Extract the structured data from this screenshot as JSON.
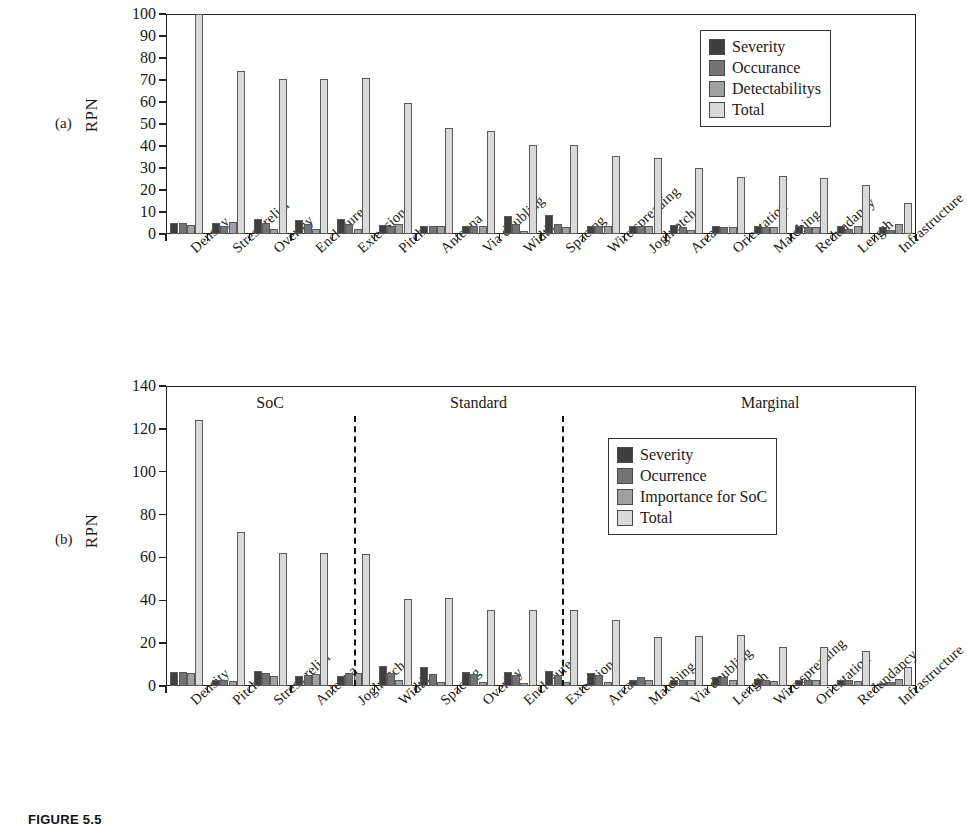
{
  "figure": {
    "caption": "FIGURE 5.5",
    "panel_a_tag": "(a)",
    "panel_b_tag": "(b)"
  },
  "chart_data": [
    {
      "id": "panel-a",
      "type": "bar",
      "title": "",
      "xlabel": "",
      "ylabel": "RPN",
      "ylim": [
        0,
        100
      ],
      "ytick_step": 10,
      "yticks": [
        0,
        10,
        20,
        30,
        40,
        50,
        60,
        70,
        80,
        90,
        100
      ],
      "grid": false,
      "legend_position": "top-right",
      "categories": [
        "Density",
        "Stress relief",
        "Overlay",
        "Enclosure",
        "Extension",
        "Pitch",
        "Antenna",
        "Via doubling",
        "Width",
        "Spacing",
        "Wire spreading",
        "Joglnotch",
        "Area",
        "Orientation",
        "Matching",
        "Redundancy",
        "Length",
        "Infrastructure"
      ],
      "series": [
        {
          "name": "Severity",
          "color": "#3f3f3f",
          "values": [
            5,
            5,
            7,
            6.5,
            7,
            4,
            3.5,
            3.5,
            8,
            8.5,
            3.5,
            3.5,
            4,
            3.5,
            3.5,
            3.5,
            3.5,
            3
          ]
        },
        {
          "name": "Occurance",
          "color": "#737373",
          "values": [
            5,
            3.5,
            5,
            4.5,
            4.5,
            3.5,
            3.5,
            3.5,
            4.5,
            4.5,
            3.5,
            3.5,
            3,
            3,
            3,
            3,
            2.5,
            2
          ]
        },
        {
          "name": "Detectabilitys",
          "color": "#a0a0a0",
          "values": [
            4,
            5.5,
            2.5,
            2.5,
            2.5,
            4.5,
            3.5,
            3.5,
            1.5,
            3,
            3.5,
            3.5,
            2,
            3,
            3,
            3,
            3.5,
            4.5
          ]
        },
        {
          "name": "Total",
          "color": "#d9d9d9",
          "values": [
            100,
            74,
            70.5,
            70.5,
            70.8,
            59.5,
            48,
            47,
            40.5,
            40.5,
            35.5,
            34.5,
            30,
            26,
            26.5,
            25.5,
            22.5,
            14
          ]
        }
      ]
    },
    {
      "id": "panel-b",
      "type": "bar",
      "title": "",
      "xlabel": "",
      "ylabel": "RPN",
      "ylim": [
        0,
        140
      ],
      "ytick_step": 20,
      "yticks": [
        0,
        20,
        40,
        60,
        80,
        100,
        120,
        140
      ],
      "grid": false,
      "legend_position": "top-right",
      "categories": [
        "Density",
        "Pitch",
        "Stress relief",
        "Antenna",
        "Joglnotch",
        "Width",
        "Spacing",
        "Overlay",
        "Enclosure",
        "Extension",
        "Area",
        "Matching",
        "Via doubling",
        "Length",
        "Wire spreading",
        "Orientation",
        "Redundancy",
        "Infrastructure"
      ],
      "series": [
        {
          "name": "Severity",
          "color": "#3f3f3f",
          "values": [
            6.5,
            3,
            7,
            4.5,
            4.5,
            9.5,
            9,
            6.5,
            6.5,
            7,
            6,
            3,
            3,
            4,
            3.5,
            3,
            3,
            1.5
          ]
        },
        {
          "name": "Ocurrence",
          "color": "#737373",
          "values": [
            6.5,
            3,
            6,
            5,
            6,
            6,
            5.5,
            5.5,
            5,
            5,
            5,
            4,
            3,
            4,
            3,
            3,
            3,
            2
          ]
        },
        {
          "name": "Importance for SoC",
          "color": "#a0a0a0",
          "values": [
            6,
            2.5,
            4.5,
            5.5,
            6,
            3,
            2,
            2,
            1.5,
            2,
            2,
            3,
            3,
            3,
            2.5,
            3,
            2.5,
            3.5
          ]
        },
        {
          "name": "Total",
          "color": "#d9d9d9",
          "values": [
            124,
            72,
            62,
            62,
            61.5,
            40.5,
            41,
            35.5,
            35.5,
            35.5,
            31,
            23,
            23.5,
            24,
            18,
            18,
            16.5,
            9
          ]
        }
      ],
      "sections": [
        {
          "label": "SoC",
          "center_index": 2
        },
        {
          "label": "Standard",
          "center_index": 7
        },
        {
          "label": "Marginal",
          "center_index": 14
        }
      ],
      "dividers": [
        4.5,
        9.5
      ]
    }
  ]
}
